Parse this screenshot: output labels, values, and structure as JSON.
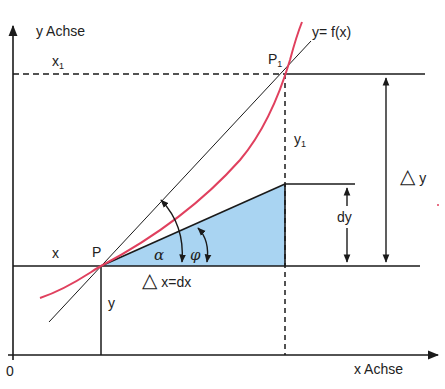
{
  "diagram": {
    "colors": {
      "curve": "#e0405e",
      "lines": "#1a1a1a",
      "triangle_fill": "#a9d4f2",
      "background": "#ffffff"
    },
    "axes": {
      "y_label": "y Achse",
      "x_label": "x Achse",
      "origin_label": "0"
    },
    "curve_label": "y= f(x)",
    "points": {
      "p": "P",
      "p1": "P",
      "p1_sub": "1"
    },
    "labels": {
      "x": "x",
      "x1": "x",
      "x1_sub": "1",
      "y": "y",
      "y1": "y",
      "y1_sub": "1",
      "alpha": "α",
      "phi": "φ",
      "delta_x_symbol": "△",
      "delta_x_text": "x=dx",
      "delta_y_symbol": "△",
      "delta_y_text": "y",
      "dy": "dy"
    }
  }
}
